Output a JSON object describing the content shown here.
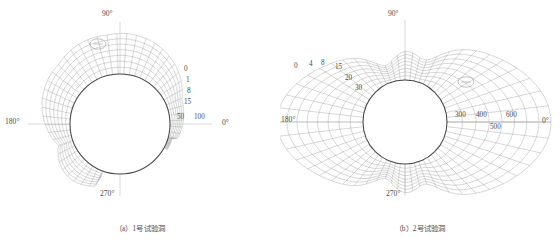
{
  "figure": {
    "type": "engineering-contour-diagram",
    "background": "#ffffff",
    "line_color": "#9a9a9a",
    "tunnel_color": "#4a4a4a",
    "axis_color": "#b0b0b0",
    "text_color": "#4a4a4a"
  },
  "panels": [
    {
      "id": "a",
      "caption": "（a）1号试验洞",
      "angles": {
        "top": "90°",
        "left": "180°",
        "bottom": "270°",
        "right": "0°"
      },
      "contour_labels": [
        "0",
        "1",
        "8",
        "15",
        "50",
        "100"
      ],
      "marker": "oval-dash-marker",
      "tunnel_radius_px": 50,
      "center": {
        "x": 120,
        "y": 124
      }
    },
    {
      "id": "b",
      "caption": "（b）2号试验洞",
      "angles": {
        "top": "90°",
        "left": "180°",
        "bottom": "270°",
        "right": "0°"
      },
      "contour_labels": [
        "0",
        "4",
        "8",
        "15",
        "20",
        "30",
        "300",
        "400",
        "500",
        "600"
      ],
      "marker": "oval-dash-marker",
      "tunnel_radius_px": 42,
      "center": {
        "x": 125,
        "y": 122
      }
    }
  ],
  "chart_data": {
    "type": "line",
    "title": "",
    "xlabel": "",
    "ylabel": "",
    "series": [
      {
        "name": "1号试验洞 contours",
        "labels": [
          "0",
          "1",
          "8",
          "15",
          "50",
          "100"
        ],
        "values": [
          0,
          1,
          8,
          15,
          50,
          100
        ]
      },
      {
        "name": "2号试验洞 contours (inner)",
        "labels": [
          "0",
          "4",
          "8",
          "15",
          "20",
          "30"
        ],
        "values": [
          0,
          4,
          8,
          15,
          20,
          30
        ]
      },
      {
        "name": "2号试验洞 contours (outer)",
        "labels": [
          "300",
          "400",
          "500",
          "600"
        ],
        "values": [
          300,
          400,
          500,
          600
        ]
      }
    ],
    "angular_ticks": [
      "0°",
      "90°",
      "180°",
      "270°"
    ],
    "grid": true,
    "legend": "none"
  }
}
